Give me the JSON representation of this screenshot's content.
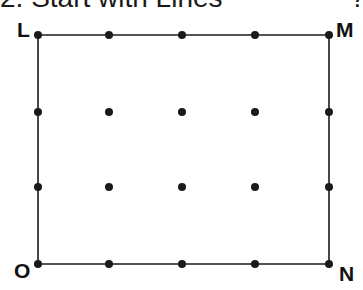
{
  "heading": {
    "text": "2. Start with Lines",
    "trailing": "?"
  },
  "diagram": {
    "colors": {
      "line": "#1a1a1a",
      "dot": "#1a1a1a",
      "label": "#111111",
      "background": "#ffffff"
    },
    "grid": {
      "columns_x": [
        38,
        109,
        182,
        255,
        329
      ],
      "rows_y": [
        35,
        112,
        187,
        264
      ],
      "dot_radius": 4
    },
    "rectangle": {
      "corners": {
        "L": {
          "x": 38,
          "y": 35
        },
        "M": {
          "x": 329,
          "y": 35
        },
        "N": {
          "x": 329,
          "y": 264
        },
        "O": {
          "x": 38,
          "y": 264
        }
      }
    },
    "labels": {
      "L": "L",
      "M": "M",
      "N": "N",
      "O": "O"
    }
  }
}
